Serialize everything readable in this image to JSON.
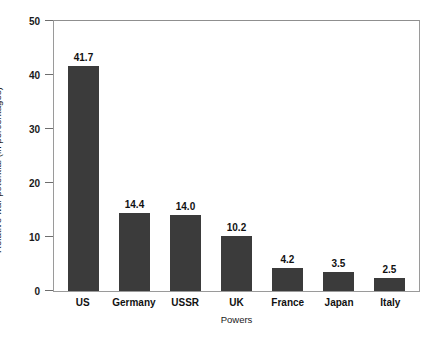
{
  "chart_data": {
    "type": "bar",
    "title": "",
    "xlabel": "Powers",
    "ylabel": "Relative war potential (in percentages)",
    "categories": [
      "US",
      "Germany",
      "USSR",
      "UK",
      "France",
      "Japan",
      "Italy"
    ],
    "values": [
      41.7,
      14.4,
      14.0,
      10.2,
      4.2,
      3.5,
      2.5
    ],
    "value_labels": [
      "41.7",
      "14.4",
      "14.0",
      "10.2",
      "4.2",
      "3.5",
      "2.5"
    ],
    "ylim": [
      0,
      50
    ],
    "yticks": [
      0,
      10,
      20,
      30,
      40,
      50
    ],
    "ytick_labels": [
      "0",
      "10",
      "20",
      "30",
      "40",
      "50"
    ],
    "grid": false,
    "legend": "none",
    "bar_color": "#3b3b3b",
    "axis_color": "#9a9a9a",
    "background": "#ffffff"
  }
}
